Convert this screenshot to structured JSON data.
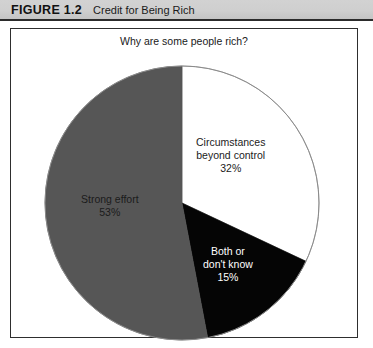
{
  "header": {
    "figure_number": "FIGURE 1.2",
    "caption": "Credit for Being Rich"
  },
  "chart_data": {
    "type": "pie",
    "title": "Why are some people rich?",
    "xlabel": "",
    "ylabel": "",
    "legend_position": "none",
    "grid": false,
    "start_angle_deg": 0,
    "direction": "clockwise",
    "categories": [
      "Circumstances beyond control",
      "Both or don't know",
      "Strong effort"
    ],
    "values": [
      32,
      15,
      53
    ],
    "unit": "%",
    "slices": [
      {
        "label": "Circumstances\nbeyond control",
        "label_line1": "Circumstances",
        "label_line2": "beyond control",
        "value": 32,
        "value_text": "32%",
        "color": "#ffffff",
        "text_color": "#1b1b1b",
        "start_deg": 0,
        "end_deg": 115.2
      },
      {
        "label": "Both or\ndon't know",
        "label_line1": "Both or",
        "label_line2": "don't know",
        "value": 15,
        "value_text": "15%",
        "color": "#050505",
        "text_color": "#ffffff",
        "start_deg": 115.2,
        "end_deg": 169.2
      },
      {
        "label": "Strong effort",
        "label_line1": "Strong effort",
        "label_line2": "",
        "value": 53,
        "value_text": "53%",
        "color": "#565656",
        "text_color": "#1b1b1b",
        "start_deg": 169.2,
        "end_deg": 360
      }
    ]
  },
  "colors": {
    "header_band": "#cfcfcf",
    "frame_border": "#2e2e2e",
    "pie_outline": "#7a7a7a",
    "slice_white": "#ffffff",
    "slice_black": "#050505",
    "slice_gray": "#565656"
  }
}
